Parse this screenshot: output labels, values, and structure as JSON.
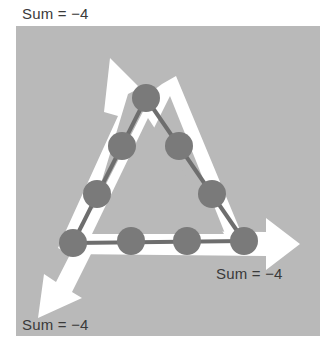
{
  "diagram": {
    "shape": "triangle",
    "node_count": 9,
    "nodes_per_side": 4,
    "colors": {
      "panel": "#b9b9b9",
      "arrow": "#ffffff",
      "node": "#7a7a7a",
      "edge": "#6e6e6e",
      "text": "#3a3a3a"
    },
    "labels": [
      {
        "id": "top-left",
        "text": "Sum = −4"
      },
      {
        "id": "bottom-right",
        "text": "Sum = −4"
      },
      {
        "id": "bottom-left",
        "text": "Sum = −4"
      }
    ],
    "arrows": [
      {
        "id": "left-side",
        "direction": "up-left"
      },
      {
        "id": "bottom-side",
        "direction": "right"
      },
      {
        "id": "right-side",
        "direction": "down-left"
      }
    ]
  }
}
